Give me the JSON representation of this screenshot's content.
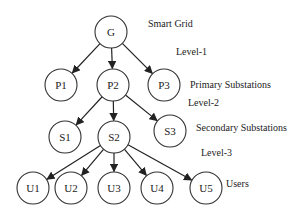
{
  "diagram": {
    "type": "hierarchical tree",
    "nodes": [
      {
        "id": "G",
        "label": "G",
        "x": 111,
        "y": 32,
        "level": 0
      },
      {
        "id": "P1",
        "label": "P1",
        "x": 61,
        "y": 85,
        "level": 1
      },
      {
        "id": "P2",
        "label": "P2",
        "x": 113,
        "y": 85,
        "level": 1
      },
      {
        "id": "P3",
        "label": "P3",
        "x": 164,
        "y": 85,
        "level": 1
      },
      {
        "id": "S1",
        "label": "S1",
        "x": 65,
        "y": 137,
        "level": 2
      },
      {
        "id": "S2",
        "label": "S2",
        "x": 114,
        "y": 137,
        "level": 2
      },
      {
        "id": "S3",
        "label": "S3",
        "x": 170,
        "y": 131,
        "level": 2
      },
      {
        "id": "U1",
        "label": "U1",
        "x": 33,
        "y": 188,
        "level": 3
      },
      {
        "id": "U2",
        "label": "U2",
        "x": 71,
        "y": 188,
        "level": 3
      },
      {
        "id": "U3",
        "label": "U3",
        "x": 114,
        "y": 188,
        "level": 3
      },
      {
        "id": "U4",
        "label": "U4",
        "x": 157,
        "y": 188,
        "level": 3
      },
      {
        "id": "U5",
        "label": "U5",
        "x": 206,
        "y": 188,
        "level": 3
      }
    ],
    "edges": [
      {
        "from": "G",
        "to": "P1"
      },
      {
        "from": "G",
        "to": "P2"
      },
      {
        "from": "G",
        "to": "P3"
      },
      {
        "from": "P2",
        "to": "S1"
      },
      {
        "from": "P2",
        "to": "S2"
      },
      {
        "from": "P2",
        "to": "S3"
      },
      {
        "from": "S2",
        "to": "U1"
      },
      {
        "from": "S2",
        "to": "U2"
      },
      {
        "from": "S2",
        "to": "U3"
      },
      {
        "from": "S2",
        "to": "U4"
      },
      {
        "from": "S2",
        "to": "U5"
      }
    ],
    "annotations": {
      "smart_grid": "Smart Grid",
      "level1": "Level-1",
      "primary": "Primary Substations",
      "level2": "Level-2",
      "secondary": "Secondary Substations",
      "level3": "Level-3",
      "users": "Users"
    }
  }
}
